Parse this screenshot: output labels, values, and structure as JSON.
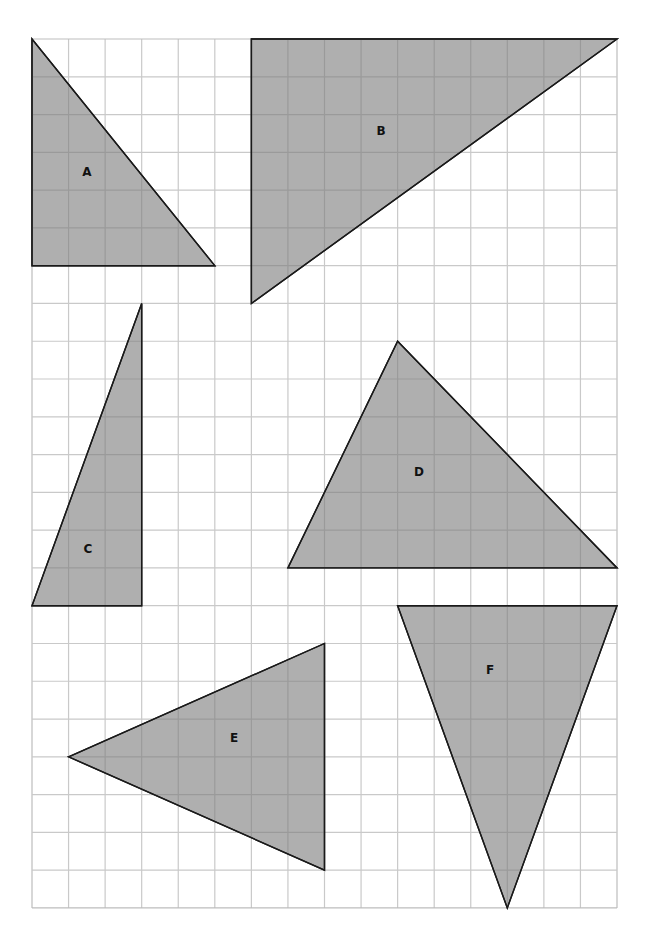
{
  "figure": {
    "grid": {
      "columns": 16,
      "rows": 23,
      "origin_px": [
        32,
        39
      ],
      "cell_w_px": 36.5625,
      "cell_h_px": 37.78,
      "line_color": "#c9c9c9",
      "border_color": "#bdbdbd"
    },
    "style": {
      "fill": "#a9a9a9",
      "stroke": "#1a1a1a",
      "stroke_width": 1.4
    },
    "triangles": [
      {
        "label": "A",
        "vertices": [
          [
            0,
            0
          ],
          [
            0,
            6
          ],
          [
            5,
            6
          ]
        ],
        "label_px": [
          87,
          172
        ]
      },
      {
        "label": "B",
        "vertices": [
          [
            6,
            0
          ],
          [
            16,
            0
          ],
          [
            6,
            7
          ]
        ],
        "label_px": [
          381,
          131
        ]
      },
      {
        "label": "C",
        "vertices": [
          [
            0,
            15
          ],
          [
            3,
            15
          ],
          [
            3,
            7
          ]
        ],
        "label_px": [
          88,
          549
        ]
      },
      {
        "label": "D",
        "vertices": [
          [
            7,
            14
          ],
          [
            10,
            8
          ],
          [
            16,
            14
          ]
        ],
        "label_px": [
          419,
          472
        ]
      },
      {
        "label": "E",
        "vertices": [
          [
            1,
            19
          ],
          [
            8,
            16
          ],
          [
            8,
            22
          ]
        ],
        "label_px": [
          234,
          738
        ]
      },
      {
        "label": "F",
        "vertices": [
          [
            10,
            15
          ],
          [
            16,
            15
          ],
          [
            13,
            23
          ]
        ],
        "label_px": [
          490,
          670
        ]
      }
    ]
  }
}
